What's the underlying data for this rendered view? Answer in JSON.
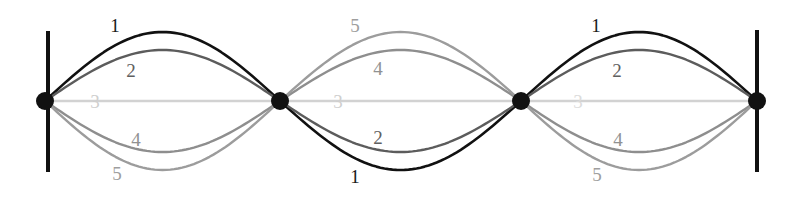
{
  "figure": {
    "background_color": "#ffffff",
    "width": 788,
    "height": 197,
    "axis_y": 101,
    "node_radius": 9,
    "node_color": "#111111",
    "wall_color": "#111111",
    "wall_width": 4,
    "walls": [
      {
        "x": 48,
        "y_top": 31,
        "y_bottom": 172
      },
      {
        "x": 757,
        "y_top": 30,
        "y_bottom": 172
      }
    ],
    "nodes": [
      {
        "name": "node-left",
        "x": 45,
        "y": 101
      },
      {
        "name": "node-second",
        "x": 280,
        "y": 101
      },
      {
        "name": "node-third",
        "x": 521,
        "y": 101
      },
      {
        "name": "node-right",
        "x": 757,
        "y": 101
      }
    ],
    "segments": [
      {
        "name": "segment-left",
        "x_start": 45,
        "x_end": 280
      },
      {
        "name": "segment-middle",
        "x_start": 280,
        "x_end": 521
      },
      {
        "name": "segment-right",
        "x_start": 521,
        "x_end": 757
      }
    ],
    "curves": [
      {
        "id": 1,
        "label": "1",
        "color": "#111111",
        "stroke_width": 2.6,
        "amplitude": 69,
        "lobe_signs": [
          -1,
          1,
          -1
        ]
      },
      {
        "id": 2,
        "label": "2",
        "color": "#5c5c5c",
        "stroke_width": 2.4,
        "amplitude": 51,
        "lobe_signs": [
          -1,
          1,
          -1
        ]
      },
      {
        "id": 3,
        "label": "3",
        "color": "#d2d2d2",
        "stroke_width": 2.4,
        "amplitude": 0,
        "lobe_signs": [
          0,
          0,
          0
        ]
      },
      {
        "id": 4,
        "label": "4",
        "color": "#8e8e8e",
        "stroke_width": 2.4,
        "amplitude": 51,
        "lobe_signs": [
          1,
          -1,
          1
        ]
      },
      {
        "id": 5,
        "label": "5",
        "color": "#9c9c9c",
        "stroke_width": 2.4,
        "amplitude": 69,
        "lobe_signs": [
          1,
          -1,
          1
        ]
      }
    ],
    "labels": [
      {
        "name": "curve-label-1-left",
        "text": "1",
        "x": 115,
        "y": 25,
        "color": "#1a1a1a",
        "size": 19
      },
      {
        "name": "curve-label-2-left",
        "text": "2",
        "x": 131,
        "y": 70,
        "color": "#5f5f5f",
        "size": 19
      },
      {
        "name": "curve-label-3-left",
        "text": "3",
        "x": 95,
        "y": 101,
        "color": "#cfcfcf",
        "size": 19
      },
      {
        "name": "curve-label-4-left",
        "text": "4",
        "x": 136,
        "y": 139,
        "color": "#919191",
        "size": 19
      },
      {
        "name": "curve-label-5-left",
        "text": "5",
        "x": 117,
        "y": 173,
        "color": "#9e9e9e",
        "size": 19
      },
      {
        "name": "curve-label-5-middle",
        "text": "5",
        "x": 355,
        "y": 25,
        "color": "#9e9e9e",
        "size": 19
      },
      {
        "name": "curve-label-4-middle",
        "text": "4",
        "x": 378,
        "y": 68,
        "color": "#919191",
        "size": 19
      },
      {
        "name": "curve-label-3-middle",
        "text": "3",
        "x": 338,
        "y": 101,
        "color": "#cfcfcf",
        "size": 19
      },
      {
        "name": "curve-label-2-middle",
        "text": "2",
        "x": 378,
        "y": 137,
        "color": "#5f5f5f",
        "size": 19
      },
      {
        "name": "curve-label-1-middle",
        "text": "1",
        "x": 355,
        "y": 176,
        "color": "#1a1a1a",
        "size": 19
      },
      {
        "name": "curve-label-1-right",
        "text": "1",
        "x": 596,
        "y": 25,
        "color": "#1a1a1a",
        "size": 19
      },
      {
        "name": "curve-label-2-right",
        "text": "2",
        "x": 617,
        "y": 70,
        "color": "#5f5f5f",
        "size": 19
      },
      {
        "name": "curve-label-3-right",
        "text": "3",
        "x": 578,
        "y": 101,
        "color": "#dcdcdc",
        "size": 19
      },
      {
        "name": "curve-label-4-right",
        "text": "4",
        "x": 618,
        "y": 139,
        "color": "#919191",
        "size": 19
      },
      {
        "name": "curve-label-5-right",
        "text": "5",
        "x": 597,
        "y": 174,
        "color": "#9e9e9e",
        "size": 19
      }
    ]
  }
}
